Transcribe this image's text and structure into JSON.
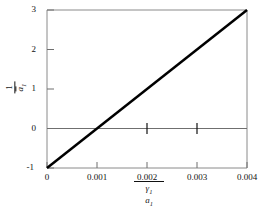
{
  "chart_data": {
    "type": "line",
    "title": "",
    "subtitle": "",
    "xlabel": "γ₁ / a₁",
    "ylabel": "1 / ā₁",
    "xlabel_numerator": "γ₁",
    "xlabel_denominator": "a₁",
    "ylabel_numerator": "1",
    "ylabel_denominator": "ā₁",
    "xlim": [
      0,
      0.004
    ],
    "ylim": [
      -1,
      3
    ],
    "xticks": [
      0,
      0.001,
      0.002,
      0.003,
      0.004
    ],
    "xtick_labels": [
      "0",
      "0.001",
      "0.002",
      "0.003",
      "0.004"
    ],
    "yticks": [
      -1,
      0,
      1,
      2,
      3
    ],
    "ytick_labels": [
      "-1",
      "0",
      "1",
      "2",
      "3"
    ],
    "grid": false,
    "legend": "none",
    "zero_line": true,
    "series": [
      {
        "name": "1/ā₁ vs γ₁/a₁",
        "x": [
          0,
          0.004
        ],
        "y": [
          -1,
          3
        ],
        "color": "#000000",
        "linewidth": 2.5,
        "points": [
          {
            "x": 0,
            "y": -1
          },
          {
            "x": 0.001,
            "y": 0
          },
          {
            "x": 0.002,
            "y": 1
          },
          {
            "x": 0.003,
            "y": 2
          },
          {
            "x": 0.004,
            "y": 3
          }
        ],
        "slope": 1000,
        "intercept": -1
      }
    ],
    "interior_tick_marks_on_zero_line": [
      0.002,
      0.003
    ]
  },
  "axes": {
    "frame_color": "#808080",
    "tick_color": "#444444",
    "text_color": "#111111"
  },
  "x_ticks": {
    "t0": "0",
    "t1": "0.001",
    "t2": "0.002",
    "t3": "0.003",
    "t4": "0.004"
  },
  "y_ticks": {
    "t3": "3",
    "t2": "2",
    "t1": "1",
    "t0": "0",
    "tm1": "-1"
  },
  "y_axis_label": {
    "numerator": "1",
    "denominator_base": "a",
    "denominator_sub": "1"
  },
  "x_axis_label": {
    "numerator_base": "γ",
    "numerator_sub": "1",
    "denominator_base": "a",
    "denominator_sub": "1"
  }
}
